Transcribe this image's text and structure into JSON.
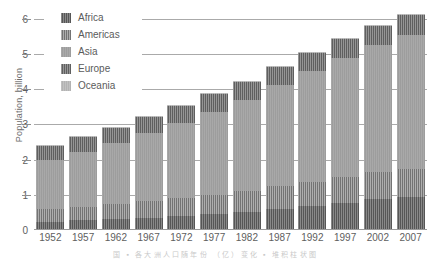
{
  "chart_data": {
    "type": "bar",
    "subtype": "stacked-bar",
    "title": "",
    "xlabel": "",
    "ylabel": "Population, billion",
    "categories": [
      "1952",
      "1957",
      "1962",
      "1967",
      "1972",
      "1977",
      "1982",
      "1987",
      "1992",
      "1997",
      "2002",
      "2007"
    ],
    "ylim": [
      0,
      6.3
    ],
    "yticks": [
      1,
      2,
      3,
      4,
      5,
      6
    ],
    "ytick_labels": [
      "1",
      "2",
      "3",
      "4",
      "5",
      "6"
    ],
    "grid": true,
    "legend_position": "upper-left-inside",
    "series": [
      {
        "name": "Africa",
        "color": "#565656",
        "values": [
          0.24,
          0.27,
          0.3,
          0.34,
          0.39,
          0.45,
          0.52,
          0.6,
          0.69,
          0.78,
          0.88,
          0.93
        ]
      },
      {
        "name": "Americas",
        "color": "#737373",
        "values": [
          0.35,
          0.39,
          0.43,
          0.47,
          0.51,
          0.55,
          0.59,
          0.64,
          0.68,
          0.73,
          0.77,
          0.8
        ]
      },
      {
        "name": "Asia",
        "color": "#9d9d9d",
        "values": [
          1.4,
          1.55,
          1.73,
          1.94,
          2.14,
          2.36,
          2.59,
          2.87,
          3.13,
          3.38,
          3.6,
          3.81
        ]
      },
      {
        "name": "Europe",
        "color": "#5f5f5f",
        "values": [
          0.42,
          0.44,
          0.46,
          0.48,
          0.5,
          0.51,
          0.52,
          0.53,
          0.54,
          0.54,
          0.55,
          0.55
        ]
      },
      {
        "name": "Oceania",
        "color": "#b3b3b3",
        "values": [
          0.011,
          0.012,
          0.014,
          0.015,
          0.016,
          0.018,
          0.019,
          0.021,
          0.023,
          0.025,
          0.027,
          0.029
        ]
      }
    ],
    "totals": [
      2.41,
      2.66,
      2.93,
      3.25,
      3.56,
      3.89,
      4.24,
      4.66,
      5.06,
      5.47,
      5.83,
      6.12
    ]
  },
  "legend": {
    "items": [
      {
        "label": "Africa"
      },
      {
        "label": "Americas"
      },
      {
        "label": "Asia"
      },
      {
        "label": "Europe"
      },
      {
        "label": "Oceania"
      }
    ]
  },
  "caption": {
    "text": "国 ▪ 各大洲人口随年份 （亿）变化 ▪ 堆积柱状图"
  }
}
